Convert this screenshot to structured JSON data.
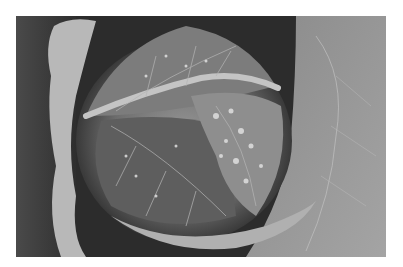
{
  "image": {
    "description": "Black and white close-up photograph of a savoy cabbage head with wrinkled, veined leaves covered in water droplets, surrounded by large outer leaves",
    "subject": "savoy cabbage",
    "style": "monochrome",
    "border_color": "#ffffff",
    "tones": {
      "shadow": "#1e1e1e",
      "dark": "#3a3a3a",
      "mid": "#707070",
      "light": "#a8a8a8",
      "highlight": "#dcdcdc"
    }
  }
}
